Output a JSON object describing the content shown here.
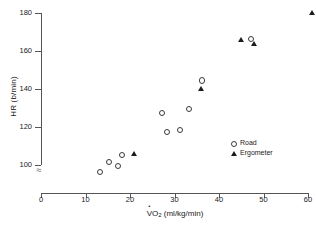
{
  "chart_data": {
    "type": "scatter",
    "title": "",
    "xlabel": "VO2 (ml/kg/min)",
    "ylabel": "HR (b/min)",
    "xlim": [
      0,
      60
    ],
    "ylim": [
      90,
      180
    ],
    "grid": false,
    "y_axis_break": true,
    "y_break_symbol": "≈",
    "x_break_symbol": "≈",
    "legend_position": "center-right",
    "xticks": [
      0,
      10,
      20,
      30,
      40,
      50,
      60
    ],
    "yticks": [
      100,
      120,
      140,
      160,
      180
    ],
    "xtick_labels": [
      "0",
      "10",
      "20",
      "30",
      "40",
      "50",
      "60"
    ],
    "ytick_labels": [
      "100",
      "120",
      "140",
      "160",
      "180"
    ],
    "series": [
      {
        "name": "Road",
        "marker": "open-circle",
        "color": "#3a3a3a",
        "points": [
          {
            "x": 13,
            "y": 97
          },
          {
            "x": 15,
            "y": 102
          },
          {
            "x": 17,
            "y": 100
          },
          {
            "x": 18,
            "y": 106
          },
          {
            "x": 27,
            "y": 128
          },
          {
            "x": 28,
            "y": 118
          },
          {
            "x": 31,
            "y": 119
          },
          {
            "x": 33,
            "y": 130
          },
          {
            "x": 36,
            "y": 145
          },
          {
            "x": 47,
            "y": 167
          }
        ]
      },
      {
        "name": "Ergometer",
        "marker": "filled-triangle",
        "color": "#1c1c1c",
        "points": [
          {
            "x": 21,
            "y": 106
          },
          {
            "x": 36,
            "y": 140
          },
          {
            "x": 45,
            "y": 166
          },
          {
            "x": 48,
            "y": 164
          },
          {
            "x": 61,
            "y": 180
          }
        ]
      }
    ]
  },
  "axis_titles": {
    "y": "HR (b/min)",
    "x_prefix": "V",
    "x_main": "O",
    "x_sub": "2",
    "x_units": " (ml/kg/min)"
  },
  "legend": {
    "items": [
      {
        "label": "Road",
        "marker": "open-circle"
      },
      {
        "label": "Ergometer",
        "marker": "filled-triangle"
      }
    ]
  }
}
